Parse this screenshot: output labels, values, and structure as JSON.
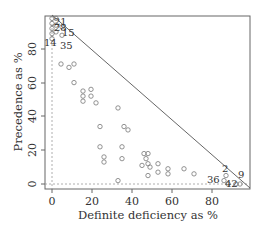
{
  "chart_data": {
    "type": "scatter",
    "title": "",
    "xlabel": "Definite deficiency as %",
    "ylabel": "Precedence as %",
    "xlim": [
      -3,
      99
    ],
    "ylim": [
      -3,
      100
    ],
    "xticks": [
      0,
      20,
      40,
      60,
      80
    ],
    "yticks": [
      0,
      20,
      40,
      60,
      80
    ],
    "grid": false,
    "legend": null,
    "reference_lines": [
      {
        "type": "line",
        "from": [
          0,
          100
        ],
        "to": [
          98,
          0
        ],
        "style": "solid"
      },
      {
        "type": "hline",
        "y": 0,
        "style": "dashed"
      },
      {
        "type": "vline",
        "x": 0,
        "style": "dashed"
      }
    ],
    "points": [
      {
        "x": 0,
        "y": 98,
        "label": ""
      },
      {
        "x": 0,
        "y": 95,
        "label": ""
      },
      {
        "x": 0,
        "y": 92,
        "label": ""
      },
      {
        "x": 0,
        "y": 89,
        "label": ""
      },
      {
        "x": 2,
        "y": 98,
        "label": "21"
      },
      {
        "x": 2,
        "y": 94,
        "label": "28"
      },
      {
        "x": 2,
        "y": 90,
        "label": ""
      },
      {
        "x": 5,
        "y": 93,
        "label": "15"
      },
      {
        "x": 0,
        "y": 86,
        "label": "14"
      },
      {
        "x": 5,
        "y": 88,
        "label": "35"
      },
      {
        "x": 4.5,
        "y": 71,
        "label": ""
      },
      {
        "x": 8.5,
        "y": 69,
        "label": ""
      },
      {
        "x": 11,
        "y": 71,
        "label": ""
      },
      {
        "x": 11,
        "y": 60,
        "label": ""
      },
      {
        "x": 15.5,
        "y": 55,
        "label": ""
      },
      {
        "x": 15.5,
        "y": 52,
        "label": ""
      },
      {
        "x": 15.5,
        "y": 49,
        "label": ""
      },
      {
        "x": 19.5,
        "y": 56,
        "label": ""
      },
      {
        "x": 19.5,
        "y": 52,
        "label": ""
      },
      {
        "x": 22,
        "y": 48,
        "label": ""
      },
      {
        "x": 33,
        "y": 45,
        "label": ""
      },
      {
        "x": 24,
        "y": 34,
        "label": ""
      },
      {
        "x": 36,
        "y": 34,
        "label": ""
      },
      {
        "x": 38,
        "y": 32,
        "label": ""
      },
      {
        "x": 24,
        "y": 22,
        "label": ""
      },
      {
        "x": 35,
        "y": 22,
        "label": ""
      },
      {
        "x": 26,
        "y": 16,
        "label": ""
      },
      {
        "x": 26,
        "y": 13,
        "label": ""
      },
      {
        "x": 35,
        "y": 15,
        "label": ""
      },
      {
        "x": 33,
        "y": 2,
        "label": ""
      },
      {
        "x": 46,
        "y": 18,
        "label": ""
      },
      {
        "x": 48,
        "y": 18,
        "label": ""
      },
      {
        "x": 47,
        "y": 15,
        "label": ""
      },
      {
        "x": 48,
        "y": 12,
        "label": "8"
      },
      {
        "x": 45,
        "y": 11,
        "label": ""
      },
      {
        "x": 49,
        "y": 10,
        "label": ""
      },
      {
        "x": 48,
        "y": 5,
        "label": ""
      },
      {
        "x": 53,
        "y": 12,
        "label": ""
      },
      {
        "x": 53,
        "y": 7,
        "label": ""
      },
      {
        "x": 58,
        "y": 9,
        "label": ""
      },
      {
        "x": 58,
        "y": 6,
        "label": "8"
      },
      {
        "x": 66,
        "y": 9,
        "label": ""
      },
      {
        "x": 71,
        "y": 6,
        "label": ""
      },
      {
        "x": 87,
        "y": 5,
        "label": "2"
      },
      {
        "x": 86,
        "y": 2,
        "label": "36"
      },
      {
        "x": 88,
        "y": 0,
        "label": "42"
      },
      {
        "x": 92,
        "y": 0,
        "label": ""
      },
      {
        "x": 94,
        "y": 0,
        "label": "9"
      }
    ]
  },
  "labels": {
    "xlabel": "Definite deficiency as %",
    "ylabel": "Precedence as %",
    "xticks": [
      "0",
      "20",
      "40",
      "60",
      "80"
    ],
    "yticks": [
      "0",
      "20",
      "40",
      "60",
      "80"
    ],
    "point_labels": {
      "p21": "21",
      "p28": "28",
      "p15": "15",
      "p14": "14",
      "p35": "35",
      "p2": "2",
      "p36": "36",
      "p42": "42",
      "p9": "9"
    }
  }
}
